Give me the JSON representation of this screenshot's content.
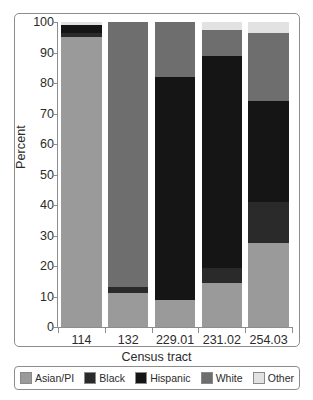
{
  "chart_data": {
    "type": "bar",
    "subtype": "stacked-bar-100-percent",
    "title": "",
    "xlabel": "Census tract",
    "ylabel": "Percent",
    "ylim": [
      0,
      100
    ],
    "yticks": [
      0,
      10,
      20,
      30,
      40,
      50,
      60,
      70,
      80,
      90,
      100
    ],
    "ytick_labels": [
      "0",
      "10",
      "20",
      "30",
      "40",
      "50",
      "60",
      "70",
      "80",
      "90",
      "100"
    ],
    "grid": false,
    "legend_position": "bottom",
    "categories": [
      "114",
      "132",
      "229.01",
      "231.02",
      "254.03"
    ],
    "series": [
      {
        "name": "Asian/PI",
        "color": "#9a9a9a",
        "values": [
          95.0,
          11.0,
          9.0,
          14.5,
          27.5
        ]
      },
      {
        "name": "Black",
        "color": "#2a2a2a",
        "values": [
          1.5,
          2.0,
          0.0,
          5.0,
          13.5
        ]
      },
      {
        "name": "Hispanic",
        "color": "#151515",
        "values": [
          2.5,
          0.0,
          73.0,
          69.5,
          33.0
        ]
      },
      {
        "name": "White",
        "color": "#6e6e6e",
        "values": [
          0.0,
          87.0,
          18.0,
          8.5,
          22.5
        ]
      },
      {
        "name": "Other",
        "color": "#e2e2e2",
        "values": [
          1.0,
          0.0,
          0.0,
          2.5,
          3.5
        ]
      }
    ]
  },
  "legend": {
    "entries": [
      {
        "label": "Asian/PI",
        "color": "#9a9a9a"
      },
      {
        "label": "Black",
        "color": "#2a2a2a"
      },
      {
        "label": "Hispanic",
        "color": "#151515"
      },
      {
        "label": "White",
        "color": "#6e6e6e"
      },
      {
        "label": "Other",
        "color": "#e2e2e2"
      }
    ]
  }
}
